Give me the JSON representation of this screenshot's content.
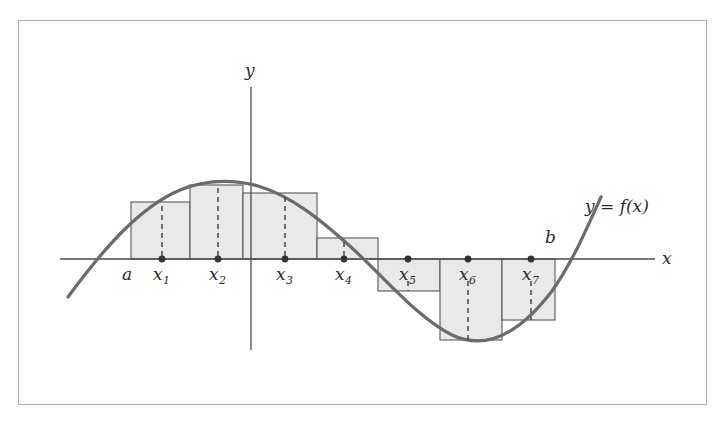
{
  "figure": {
    "kind": "riemann-sum-diagram",
    "frame": {
      "x": 18,
      "y": 20,
      "width": 689,
      "height": 385,
      "border_color": "#b0b0b0"
    }
  },
  "axes": {
    "x_axis": {
      "label": "x",
      "y_pixel": 259,
      "x_start": 60,
      "x_end": 655,
      "label_x": 662,
      "label_y": 250
    },
    "y_axis": {
      "label": "y",
      "x_pixel": 251,
      "y_start": 87,
      "y_end": 350,
      "label_x": 245,
      "label_y": 62
    },
    "axis_color": "#4a4a4a"
  },
  "curve": {
    "label": "y = f(x)",
    "label_prefix": "y",
    "label_equals": "=",
    "label_function": "f(x)",
    "label_x": 585,
    "label_y": 198,
    "color": "#6b6b6b",
    "stroke_width": 3.2,
    "path": "M 68,297 C 104,248 140,207 180,190 C 205,180 232,179 258,186 C 292,196 322,221 352,248 C 388,281 418,318 452,335 C 486,351 520,333 552,291 C 572,263 588,226 601,197"
  },
  "endpoints": {
    "a": {
      "label": "a",
      "x": 131,
      "label_x": 122,
      "label_y": 266
    },
    "b": {
      "label": "b",
      "x": 555,
      "label_x": 545,
      "label_y": 229
    }
  },
  "colors": {
    "rect_fill": "#e9e9e9",
    "rect_stroke": "#585858",
    "dot_fill": "#333333",
    "dash_color": "#3a3a3a",
    "curve": "#6b6b6b"
  },
  "chart_data": {
    "type": "area",
    "title": "",
    "xlabel": "x",
    "ylabel": "y",
    "curve_label": "y = f(x)",
    "baseline_y_pixel": 259,
    "interval": {
      "a_pixel": 131,
      "b_pixel": 555
    },
    "sample_point_labels": [
      "x_1",
      "x_2",
      "x_3",
      "x_4",
      "x_5",
      "x_6",
      "x_7"
    ],
    "rectangles": [
      {
        "label": "x",
        "sub": "1",
        "left": 131,
        "right": 190,
        "top": 202,
        "bottom": 259,
        "sample_x": 162,
        "sign": "positive",
        "height_px": 57
      },
      {
        "label": "x",
        "sub": "2",
        "left": 190,
        "right": 243,
        "top": 185,
        "bottom": 259,
        "sample_x": 218,
        "sign": "positive",
        "height_px": 74
      },
      {
        "label": "x",
        "sub": "3",
        "left": 243,
        "right": 317,
        "top": 193,
        "bottom": 259,
        "sample_x": 285,
        "sign": "positive",
        "height_px": 66
      },
      {
        "label": "x",
        "sub": "4",
        "left": 317,
        "right": 378,
        "top": 238,
        "bottom": 259,
        "sample_x": 344,
        "sign": "positive",
        "height_px": 21
      },
      {
        "label": "x",
        "sub": "5",
        "left": 378,
        "right": 440,
        "top": 259,
        "bottom": 291,
        "sample_x": 408,
        "sign": "negative",
        "height_px": 32
      },
      {
        "label": "x",
        "sub": "6",
        "left": 440,
        "right": 502,
        "top": 259,
        "bottom": 340,
        "sample_x": 468,
        "sign": "negative",
        "height_px": 81
      },
      {
        "label": "x",
        "sub": "7",
        "left": 502,
        "right": 555,
        "top": 259,
        "bottom": 320,
        "sample_x": 531,
        "sign": "negative",
        "height_px": 61
      }
    ],
    "tick_text_y": 266,
    "tick_text_y_negative": 266
  }
}
